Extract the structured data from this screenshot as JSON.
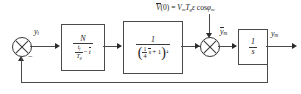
{
  "diagram": {
    "colors": {
      "line": "#4a4a4a",
      "text": "#1a1a1a",
      "background": "#ffffff"
    },
    "input_sum": {
      "name": "summing-junction-1",
      "sign_label": "−",
      "output_label": "y",
      "output_label_sub": "t"
    },
    "gain_block": {
      "name": "gain-block",
      "numerator": "N",
      "denominator_frac_num": "t",
      "denominator_frac_num_sub": "f",
      "denominator_frac_den": "T",
      "denominator_frac_den_sub": "g",
      "denominator_minus": "−",
      "denominator_term": "t"
    },
    "lag_block": {
      "name": "lag-block",
      "numerator": "1",
      "den_open": "(",
      "den_frac_num": "1",
      "den_frac_den": "4",
      "den_var": "s",
      "den_plus": "+ 1",
      "den_close": ")",
      "den_exponent": "4"
    },
    "disturbance": {
      "name": "initial-condition-annotation",
      "v_symbol": "V",
      "v_arg": "(0) =",
      "vm": "V",
      "vm_sub": "m",
      "tg": "T",
      "tg_sub": "g",
      "epsilon": "ε",
      "cos": "cos",
      "phi": "φ",
      "phi_sub": "m"
    },
    "disturbance_sum": {
      "name": "summing-junction-2",
      "output_label": "y",
      "output_label_sub": "m"
    },
    "integrator_block": {
      "name": "integrator-block",
      "numerator": "1",
      "denominator": "s"
    },
    "output": {
      "name": "output-signal",
      "label": "y",
      "label_sub": "m"
    },
    "feedback": {
      "name": "feedback-path"
    }
  }
}
